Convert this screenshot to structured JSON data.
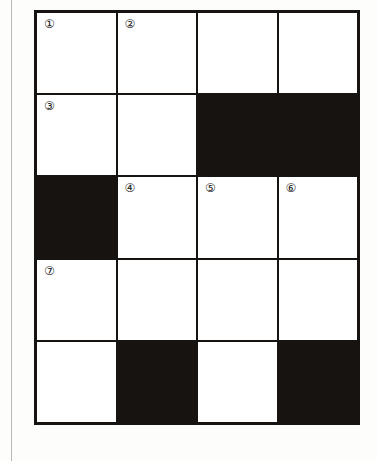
{
  "puzzle": {
    "type": "crossword-grid",
    "columns": 4,
    "rows": 5,
    "colors": {
      "block": "#161310",
      "open": "#ffffff",
      "rule": "#b9b9b9",
      "number_text": "#1a1a1a"
    },
    "cells": [
      {
        "row": 1,
        "col": 1,
        "state": "open",
        "number": "①"
      },
      {
        "row": 1,
        "col": 2,
        "state": "open",
        "number": "②"
      },
      {
        "row": 1,
        "col": 3,
        "state": "open",
        "number": ""
      },
      {
        "row": 1,
        "col": 4,
        "state": "open",
        "number": ""
      },
      {
        "row": 2,
        "col": 1,
        "state": "open",
        "number": "③"
      },
      {
        "row": 2,
        "col": 2,
        "state": "open",
        "number": ""
      },
      {
        "row": 2,
        "col": 3,
        "state": "block",
        "number": ""
      },
      {
        "row": 2,
        "col": 4,
        "state": "block",
        "number": ""
      },
      {
        "row": 3,
        "col": 1,
        "state": "block",
        "number": ""
      },
      {
        "row": 3,
        "col": 2,
        "state": "open",
        "number": "④"
      },
      {
        "row": 3,
        "col": 3,
        "state": "open",
        "number": "⑤"
      },
      {
        "row": 3,
        "col": 4,
        "state": "open",
        "number": "⑥"
      },
      {
        "row": 4,
        "col": 1,
        "state": "open",
        "number": "⑦"
      },
      {
        "row": 4,
        "col": 2,
        "state": "open",
        "number": ""
      },
      {
        "row": 4,
        "col": 3,
        "state": "open",
        "number": ""
      },
      {
        "row": 4,
        "col": 4,
        "state": "open",
        "number": ""
      },
      {
        "row": 5,
        "col": 1,
        "state": "open",
        "number": ""
      },
      {
        "row": 5,
        "col": 2,
        "state": "block",
        "number": ""
      },
      {
        "row": 5,
        "col": 3,
        "state": "open",
        "number": ""
      },
      {
        "row": 5,
        "col": 4,
        "state": "block",
        "number": ""
      }
    ]
  }
}
